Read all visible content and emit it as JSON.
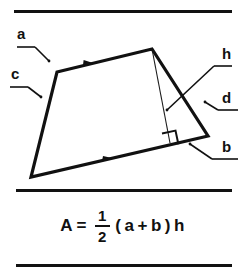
{
  "figure": {
    "type": "trapezoid-area-diagram",
    "caption_top": "",
    "colors": {
      "ink": "#111111",
      "rule": "#121212",
      "background": "#ffffff",
      "thin_line": "#1a1a1a"
    },
    "labels": {
      "side_a": "a",
      "side_b": "b",
      "side_c": "c",
      "side_d": "d",
      "height_h": "h"
    },
    "shape": {
      "name": "trapezoid",
      "vertices": {
        "top_left": [
          57,
          58
        ],
        "top_right": [
          152,
          35
        ],
        "bottom_right": [
          208,
          122
        ],
        "bottom_left": [
          31,
          163
        ]
      },
      "height_line": {
        "from": [
          152,
          35
        ],
        "to": [
          170,
          128
        ]
      },
      "right_angle_marker": [
        172,
        120
      ],
      "parallel_marks": [
        {
          "side": "a",
          "at": [
            88,
            48
          ]
        },
        {
          "side": "b",
          "at": [
            108,
            144
          ]
        }
      ]
    },
    "formula": {
      "lhs": "A",
      "equals": "=",
      "fraction_numerator": "1",
      "fraction_denominator": "2",
      "open_paren": "(",
      "term_a": "a",
      "plus": "+",
      "term_b": "b",
      "close_paren": ")",
      "term_h": "h",
      "plain_text": "A = 1/2 ( a + b ) h"
    }
  }
}
